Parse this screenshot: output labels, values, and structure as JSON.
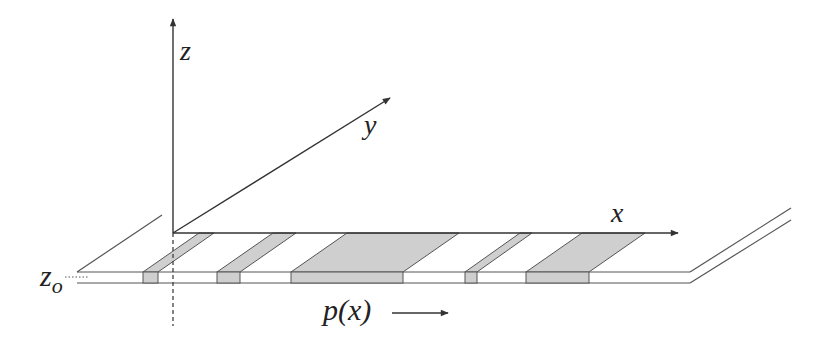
{
  "diagram": {
    "type": "3d-coordinate-schematic",
    "axes": {
      "z": {
        "label": "z"
      },
      "y": {
        "label": "y"
      },
      "x": {
        "label": "x"
      }
    },
    "surface_label": {
      "base": "z",
      "subscript": "o"
    },
    "profile_label": "p(x)",
    "profile_arrow": "→",
    "colors": {
      "line": "#333333",
      "stripe_fill": "#cfcfcf",
      "background": "#ffffff"
    },
    "stripes": [
      {
        "front_x0": 143,
        "front_x1": 158
      },
      {
        "front_x0": 217,
        "front_x1": 240
      },
      {
        "front_x0": 291,
        "front_x1": 403
      },
      {
        "front_x0": 465,
        "front_x1": 477
      },
      {
        "front_x0": 526,
        "front_x1": 589
      }
    ]
  }
}
